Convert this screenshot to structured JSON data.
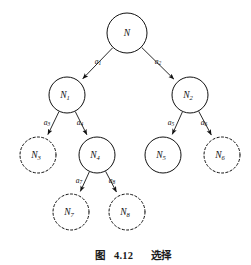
{
  "figure": {
    "caption_prefix": "图",
    "caption_number": "4.12",
    "caption_title": "选择",
    "caption_full": "图 4.12　选择",
    "stroke_color": "#111111",
    "background_color": "#ffffff"
  },
  "diagram": {
    "type": "tree",
    "nodes": [
      {
        "id": "N",
        "base": "N",
        "sub": "",
        "cx": 127,
        "cy": 33,
        "r": 20,
        "style": "solid",
        "level": 0
      },
      {
        "id": "N1",
        "base": "N",
        "sub": "1",
        "cx": 67,
        "cy": 95,
        "r": 18,
        "style": "solid",
        "level": 1
      },
      {
        "id": "N2",
        "base": "N",
        "sub": "2",
        "cx": 190,
        "cy": 95,
        "r": 18,
        "style": "solid",
        "level": 1
      },
      {
        "id": "N3",
        "base": "N",
        "sub": "3",
        "cx": 38,
        "cy": 155,
        "r": 18,
        "style": "dashed",
        "level": 2
      },
      {
        "id": "N4",
        "base": "N",
        "sub": "4",
        "cx": 97,
        "cy": 155,
        "r": 18,
        "style": "solid",
        "level": 2
      },
      {
        "id": "N5",
        "base": "N",
        "sub": "5",
        "cx": 163,
        "cy": 155,
        "r": 18,
        "style": "solid",
        "level": 2
      },
      {
        "id": "N6",
        "base": "N",
        "sub": "6",
        "cx": 222,
        "cy": 155,
        "r": 18,
        "style": "dashed",
        "level": 2
      },
      {
        "id": "N7",
        "base": "N",
        "sub": "7",
        "cx": 71,
        "cy": 212,
        "r": 18,
        "style": "dashed",
        "level": 3
      },
      {
        "id": "N8",
        "base": "N",
        "sub": "8",
        "cx": 127,
        "cy": 212,
        "r": 18,
        "style": "dashed",
        "level": 3
      }
    ],
    "edges": [
      {
        "id": "e1",
        "from": "N",
        "to": "N1",
        "base": "a",
        "sub": "1",
        "lx": 98,
        "ly": 62
      },
      {
        "id": "e2",
        "from": "N",
        "to": "N2",
        "base": "a",
        "sub": "2",
        "lx": 158,
        "ly": 62
      },
      {
        "id": "e3",
        "from": "N1",
        "to": "N3",
        "base": "a",
        "sub": "3",
        "lx": 47,
        "ly": 123
      },
      {
        "id": "e4",
        "from": "N1",
        "to": "N4",
        "base": "a",
        "sub": "4",
        "lx": 80,
        "ly": 123
      },
      {
        "id": "e5",
        "from": "N2",
        "to": "N5",
        "base": "a",
        "sub": "5",
        "lx": 171,
        "ly": 123
      },
      {
        "id": "e6",
        "from": "N2",
        "to": "N6",
        "base": "a",
        "sub": "6",
        "lx": 204,
        "ly": 123
      },
      {
        "id": "e7",
        "from": "N4",
        "to": "N7",
        "base": "a",
        "sub": "7",
        "lx": 79,
        "ly": 181
      },
      {
        "id": "e8",
        "from": "N4",
        "to": "N8",
        "base": "a",
        "sub": "8",
        "lx": 112,
        "ly": 181
      }
    ]
  }
}
